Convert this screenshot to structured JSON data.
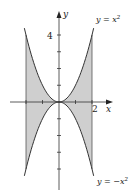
{
  "chart_data": {
    "type": "area",
    "title": "",
    "xlabel": "x",
    "ylabel": "y",
    "xlim": [
      -2.9,
      3.2
    ],
    "ylim": [
      -5.3,
      5.4
    ],
    "grid": false,
    "x_tick_labels": [
      {
        "value": 2,
        "label": "2"
      }
    ],
    "y_tick_labels": [
      {
        "value": 4,
        "label": "4"
      }
    ],
    "x_ticks": [
      -2,
      -1,
      1,
      2
    ],
    "y_ticks": [
      -4,
      -3,
      -2,
      -1,
      1,
      2,
      3,
      4
    ],
    "series": [
      {
        "name": "y = x²",
        "function": "x^2",
        "domain": [
          -2.1,
          2.1
        ],
        "color": "#333333",
        "x": [
          -2,
          -1,
          0,
          1,
          2
        ],
        "values": [
          4,
          1,
          0,
          1,
          4
        ]
      },
      {
        "name": "y = −x²",
        "function": "-x^2",
        "domain": [
          -2.1,
          2.1
        ],
        "color": "#333333",
        "x": [
          -2,
          -1,
          0,
          1,
          2
        ],
        "values": [
          -4,
          -1,
          0,
          -1,
          -4
        ]
      }
    ],
    "shaded_region": {
      "description": "Region between y = x² and y = −x² for −2 ≤ x ≤ 2",
      "x_bounds": [
        -2,
        2
      ],
      "fill": "#cfcfcf"
    },
    "annotations": [
      {
        "text": "y = x²",
        "anchor_x": 2.1,
        "anchor_y": 4.4
      },
      {
        "text": "y = −x²",
        "anchor_x": 2.1,
        "anchor_y": -4.4
      }
    ]
  },
  "labels": {
    "x_axis": "x",
    "y_axis": "y",
    "tick_x2": "2",
    "tick_y4": "4",
    "upper_curve_prefix": "y = x",
    "upper_curve_exp": "2",
    "lower_curve_prefix": "y = −x",
    "lower_curve_exp": "2"
  }
}
